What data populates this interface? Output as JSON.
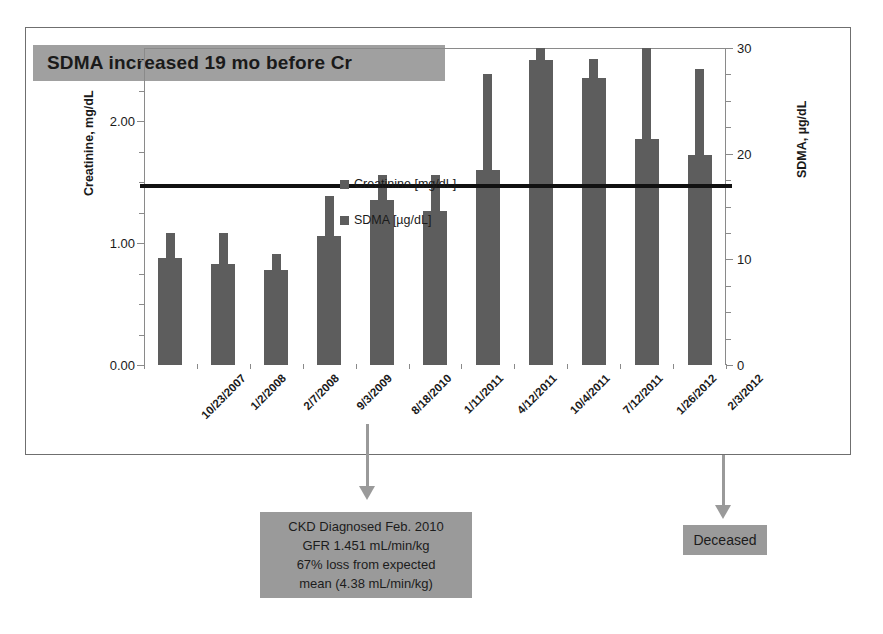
{
  "title": {
    "text": "SDMA increased 19 mo before Cr",
    "banner_color": "#a0a0a0"
  },
  "legend": {
    "items": [
      {
        "label": "Creatinine [mg/dL]",
        "color": "#5d5d5d",
        "swatch": "square-swatch-icon"
      },
      {
        "label": "SDMA [µg/dL]",
        "color": "#5d5d5d",
        "swatch": "square-swatch-icon"
      }
    ]
  },
  "axes": {
    "left_title": "Creatinine, mg/dL",
    "right_title": "SDMA, µg/dL",
    "left_ticks": [
      "0.00",
      "1.00",
      "2.00"
    ],
    "right_ticks": [
      "0",
      "10",
      "20",
      "30"
    ]
  },
  "annotations": {
    "ckd_box": {
      "lines": [
        "CKD Diagnosed Feb. 2010",
        "GFR 1.451 mL/min/kg",
        "67% loss from expected",
        "mean (4.38 mL/min/kg)"
      ],
      "color": "#9a9a9a",
      "arrow": "down-arrow-icon"
    },
    "deceased_box": {
      "lines": [
        "Deceased"
      ],
      "color": "#9a9a9a",
      "arrow": "down-arrow-icon"
    }
  },
  "chart_data": {
    "type": "bar",
    "title": "SDMA increased 19 mo before Cr",
    "xlabel": "",
    "ylabel": "Creatinine, mg/dL",
    "y2label": "SDMA, µg/dL",
    "ylim": [
      0.0,
      2.6
    ],
    "y2lim": [
      0,
      30
    ],
    "yticks": [
      0.0,
      1.0,
      2.0
    ],
    "y2ticks": [
      0,
      10,
      20,
      30
    ],
    "grid": false,
    "legend_position": "inside-upper-left",
    "categories": [
      "10/23/2007",
      "1/2/2008",
      "2/7/2008",
      "9/3/2009",
      "8/18/2010",
      "1/11/2011",
      "4/12/2011",
      "10/4/2011",
      "7/12/2011",
      "1/26/2012",
      "2/3/2012"
    ],
    "series": [
      {
        "name": "Creatinine [mg/dL]",
        "axis": "left",
        "units": "mg/dL",
        "color": "#5d5d5d",
        "values": [
          0.88,
          0.83,
          0.78,
          1.06,
          1.35,
          1.26,
          1.6,
          2.5,
          2.35,
          1.85,
          1.72
        ]
      },
      {
        "name": "SDMA [µg/dL]",
        "axis": "right",
        "units": "µg/dL",
        "color": "#5d5d5d",
        "values": [
          12.5,
          12.5,
          10.5,
          16.0,
          18.0,
          18.0,
          27.5,
          30.0,
          29.0,
          30.0,
          28.0
        ]
      }
    ],
    "reference_line": {
      "label": "Creatinine upper reference limit",
      "value": 1.47,
      "axis": "left",
      "color": "#111111"
    }
  }
}
